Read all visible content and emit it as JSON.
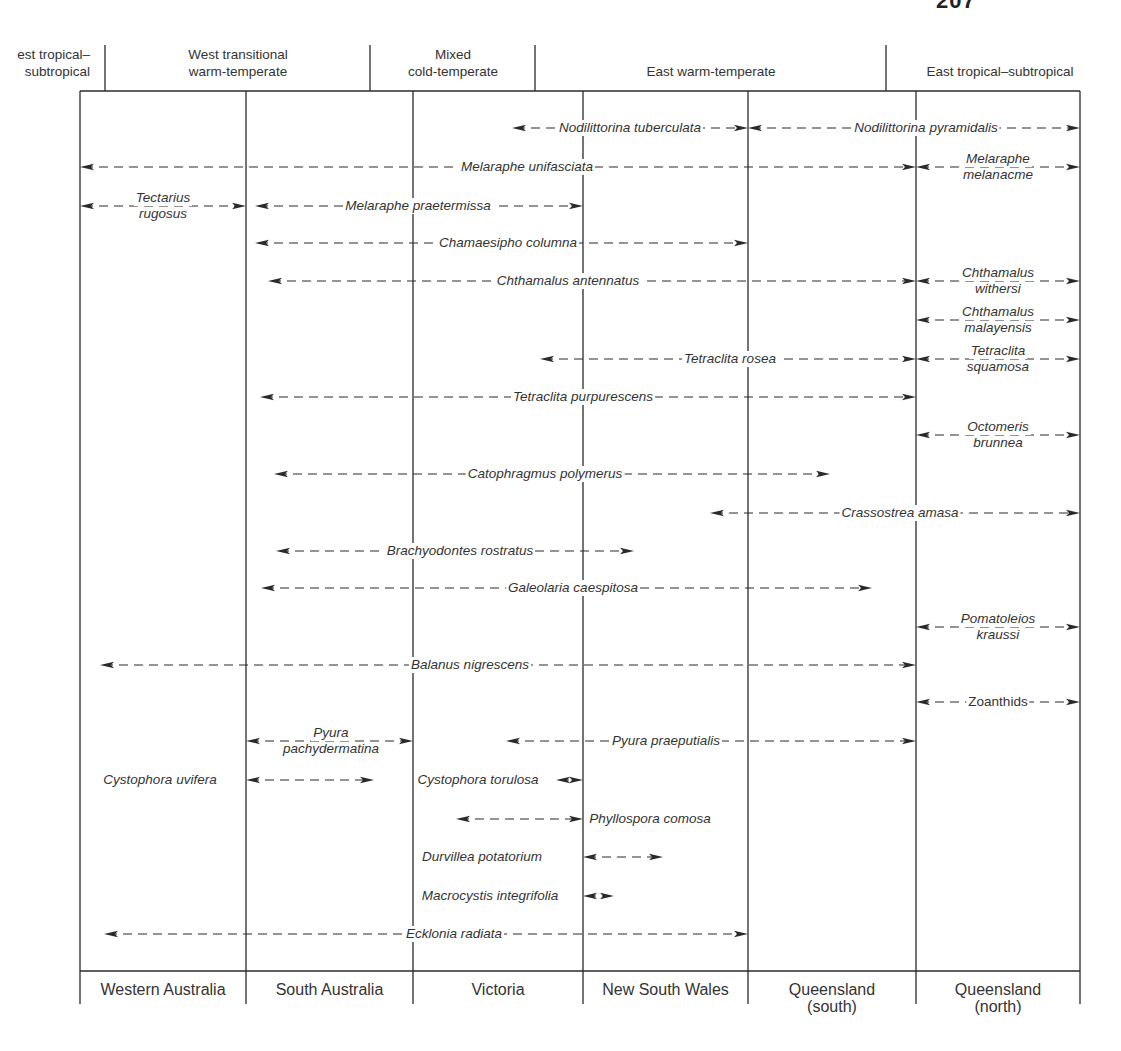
{
  "page": {
    "number_fragment": "207"
  },
  "zones": [
    {
      "label_line1": "est tropical–",
      "label_line2": "subtropical",
      "cx": 45
    },
    {
      "label_line1": "West transitional",
      "label_line2": "warm-temperate",
      "cx": 238
    },
    {
      "label_line1": "Mixed",
      "label_line2": "cold-temperate",
      "cx": 453
    },
    {
      "label_line1": "",
      "label_line2": "East warm-temperate",
      "cx": 711
    },
    {
      "label_line1": "",
      "label_line2": "East tropical–subtropical",
      "cx": 1000
    }
  ],
  "states": [
    {
      "line1": "Western Australia",
      "line2": ""
    },
    {
      "line1": "South Australia",
      "line2": ""
    },
    {
      "line1": "Victoria",
      "line2": ""
    },
    {
      "line1": "New South Wales",
      "line2": ""
    },
    {
      "line1": "Queensland",
      "line2": "(south)"
    },
    {
      "line1": "Queensland",
      "line2": "(north)"
    }
  ],
  "chart_data": {
    "type": "range-diagram",
    "columns": [
      "Western Australia",
      "South Australia",
      "Victoria",
      "New South Wales",
      "Queensland (south)",
      "Queensland (north)"
    ],
    "biogeographic_zones": [
      "West tropical–subtropical",
      "West transitional warm-temperate",
      "Mixed cold-temperate",
      "East warm-temperate",
      "East tropical–subtropical"
    ],
    "species": [
      {
        "name": "Nodilittorina tuberculata",
        "x1": 512,
        "x2": 748,
        "y": 128,
        "label_x": 630
      },
      {
        "name": "Nodilittorina pyramidalis",
        "x1": 748,
        "x2": 1080,
        "y": 128,
        "label_x": 926
      },
      {
        "name": "Melaraphe unifasciata",
        "x1": 80,
        "x2": 916,
        "y": 167,
        "label_x": 527
      },
      {
        "name": "Melaraphe melanacme",
        "x1": 916,
        "x2": 1080,
        "y": 167,
        "label_x": 998,
        "two_line": true
      },
      {
        "name": "Tectarius rugosus",
        "x1": 80,
        "x2": 246,
        "y": 206,
        "label_x": 163,
        "two_line": true
      },
      {
        "name": "Melaraphe praetermissa",
        "x1": 255,
        "x2": 583,
        "y": 206,
        "label_x": 418
      },
      {
        "name": "Chamaesipho columna",
        "x1": 255,
        "x2": 748,
        "y": 243,
        "label_x": 508
      },
      {
        "name": "Chthamalus antennatus",
        "x1": 268,
        "x2": 916,
        "y": 281,
        "label_x": 568
      },
      {
        "name": "Chthamalus withersi",
        "x1": 916,
        "x2": 1080,
        "y": 281,
        "label_x": 998,
        "two_line": true
      },
      {
        "name": "Chthamalus malayensis",
        "x1": 916,
        "x2": 1080,
        "y": 320,
        "label_x": 998,
        "two_line": true
      },
      {
        "name": "Tetraclita rosea",
        "x1": 540,
        "x2": 916,
        "y": 359,
        "label_x": 730
      },
      {
        "name": "Tetraclita squamosa",
        "x1": 916,
        "x2": 1080,
        "y": 359,
        "label_x": 998,
        "two_line": true
      },
      {
        "name": "Tetraclita purpurescens",
        "x1": 260,
        "x2": 916,
        "y": 397,
        "label_x": 583
      },
      {
        "name": "Octomeris brunnea",
        "x1": 916,
        "x2": 1080,
        "y": 435,
        "label_x": 998,
        "two_line": true
      },
      {
        "name": "Catophragmus polymerus",
        "x1": 274,
        "x2": 830,
        "y": 474,
        "label_x": 545
      },
      {
        "name": "Crassostrea amasa",
        "x1": 710,
        "x2": 1080,
        "y": 513,
        "label_x": 900
      },
      {
        "name": "Brachyodontes rostratus",
        "x1": 276,
        "x2": 634,
        "y": 551,
        "label_x": 460
      },
      {
        "name": "Galeolaria caespitosa",
        "x1": 261,
        "x2": 872,
        "y": 588,
        "label_x": 573
      },
      {
        "name": "Pomatoleios kraussi",
        "x1": 916,
        "x2": 1080,
        "y": 627,
        "label_x": 998,
        "two_line": true
      },
      {
        "name": "Balanus nigrescens",
        "x1": 100,
        "x2": 916,
        "y": 665,
        "label_x": 470
      },
      {
        "name": "Zoanthids",
        "x1": 916,
        "x2": 1080,
        "y": 702,
        "label_x": 998,
        "upright": true
      },
      {
        "name": "Pyura pachydermatina",
        "x1": 246,
        "x2": 413,
        "y": 741,
        "label_x": 331,
        "two_line": true
      },
      {
        "name": "Pyura praeputialis",
        "x1": 506,
        "x2": 916,
        "y": 741,
        "label_x": 666
      },
      {
        "name": "Cystophora uvifera",
        "x1": 246,
        "x2": 374,
        "y": 780,
        "label_x": 160,
        "label_left_of_line": true
      },
      {
        "name": "Cystophora torulosa",
        "x1": 556,
        "x2": 583,
        "y": 780,
        "label_x": 478,
        "label_left_of_line": true
      },
      {
        "name": "Phyllospora comosa",
        "x1": 456,
        "x2": 583,
        "y": 819,
        "label_x": 650
      },
      {
        "name": "Durvillea potatorium",
        "x1": 583,
        "x2": 663,
        "y": 857,
        "label_x": 482,
        "label_left_of_line": true
      },
      {
        "name": "Macrocystis integrifolia",
        "x1": 583,
        "x2": 614,
        "y": 896,
        "label_x": 490,
        "label_left_of_line": true
      },
      {
        "name": "Ecklonia radiata",
        "x1": 104,
        "x2": 748,
        "y": 934,
        "label_x": 454
      }
    ]
  }
}
